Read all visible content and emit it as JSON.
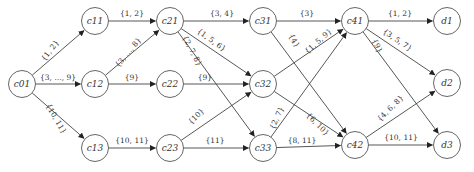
{
  "diagram": {
    "type": "directed-graph",
    "nodes": [
      {
        "id": "c01",
        "label": "c01",
        "x": 22,
        "y": 84
      },
      {
        "id": "c11",
        "label": "c11",
        "x": 95,
        "y": 21
      },
      {
        "id": "c12",
        "label": "c12",
        "x": 95,
        "y": 84
      },
      {
        "id": "c13",
        "label": "c13",
        "x": 95,
        "y": 148
      },
      {
        "id": "c21",
        "label": "c21",
        "x": 170,
        "y": 21
      },
      {
        "id": "c22",
        "label": "c22",
        "x": 170,
        "y": 84
      },
      {
        "id": "c23",
        "label": "c23",
        "x": 170,
        "y": 148
      },
      {
        "id": "c31",
        "label": "c31",
        "x": 263,
        "y": 21
      },
      {
        "id": "c32",
        "label": "c32",
        "x": 263,
        "y": 84
      },
      {
        "id": "c33",
        "label": "c33",
        "x": 263,
        "y": 148
      },
      {
        "id": "c41",
        "label": "c41",
        "x": 355,
        "y": 21
      },
      {
        "id": "c42",
        "label": "c42",
        "x": 355,
        "y": 145
      },
      {
        "id": "d1",
        "label": "d1",
        "x": 447,
        "y": 21
      },
      {
        "id": "d2",
        "label": "d2",
        "x": 447,
        "y": 83
      },
      {
        "id": "d3",
        "label": "d3",
        "x": 447,
        "y": 145
      }
    ],
    "edges": [
      {
        "from": "c01",
        "to": "c11",
        "label": "{1, 2}",
        "lx": 52,
        "ly": 52,
        "rot": -52
      },
      {
        "from": "c01",
        "to": "c12",
        "label": "{3, …, 9}",
        "lx": 58,
        "ly": 80,
        "rot": 0
      },
      {
        "from": "c01",
        "to": "c13",
        "label": "{10, 11}",
        "lx": 54,
        "ly": 120,
        "rot": 60
      },
      {
        "from": "c11",
        "to": "c21",
        "label": "{1, 2}",
        "lx": 132,
        "ly": 16,
        "rot": 0
      },
      {
        "from": "c12",
        "to": "c21",
        "label": "{3, …, 8}",
        "lx": 130,
        "ly": 54,
        "rot": -50
      },
      {
        "from": "c12",
        "to": "c22",
        "label": "{9}",
        "lx": 132,
        "ly": 80,
        "rot": 0
      },
      {
        "from": "c13",
        "to": "c23",
        "label": "{10, 11}",
        "lx": 132,
        "ly": 143,
        "rot": 0
      },
      {
        "from": "c21",
        "to": "c31",
        "label": "{3, 4}",
        "lx": 222,
        "ly": 16,
        "rot": 0
      },
      {
        "from": "c21",
        "to": "c32",
        "label": "{1, 5, 6}",
        "lx": 210,
        "ly": 42,
        "rot": 36
      },
      {
        "from": "c21",
        "to": "c33",
        "label": "{2, 7, 8}",
        "lx": 190,
        "ly": 52,
        "rot": 62
      },
      {
        "from": "c22",
        "to": "c32",
        "label": "{9}",
        "lx": 205,
        "ly": 80,
        "rot": 0
      },
      {
        "from": "c23",
        "to": "c32",
        "label": "{10}",
        "lx": 198,
        "ly": 118,
        "rot": -45
      },
      {
        "from": "c23",
        "to": "c33",
        "label": "{11}",
        "lx": 215,
        "ly": 143,
        "rot": 0
      },
      {
        "from": "c31",
        "to": "c41",
        "label": "{3}",
        "lx": 307,
        "ly": 16,
        "rot": 0
      },
      {
        "from": "c31",
        "to": "c42",
        "label": "{4}",
        "lx": 292,
        "ly": 42,
        "rot": 60
      },
      {
        "from": "c32",
        "to": "c41",
        "label": "{1, 5, 9}",
        "lx": 320,
        "ly": 43,
        "rot": -42
      },
      {
        "from": "c32",
        "to": "c42",
        "label": "{6, 10}",
        "lx": 316,
        "ly": 126,
        "rot": 45
      },
      {
        "from": "c33",
        "to": "c41",
        "label": "{2, 7}",
        "lx": 279,
        "ly": 119,
        "rot": -66
      },
      {
        "from": "c33",
        "to": "c42",
        "label": "{8, 11}",
        "lx": 302,
        "ly": 143,
        "rot": 0
      },
      {
        "from": "c41",
        "to": "d1",
        "label": "{1, 2}",
        "lx": 400,
        "ly": 16,
        "rot": 0
      },
      {
        "from": "c41",
        "to": "d2",
        "label": "{3, 5, 7}",
        "lx": 396,
        "ly": 42,
        "rot": 34
      },
      {
        "from": "c41",
        "to": "d3",
        "label": "{9}",
        "lx": 375,
        "ly": 47,
        "rot": 64
      },
      {
        "from": "c42",
        "to": "d2",
        "label": "{4, 6, 8}",
        "lx": 392,
        "ly": 110,
        "rot": -45
      },
      {
        "from": "c42",
        "to": "d3",
        "label": "{10, 11}",
        "lx": 401,
        "ly": 140,
        "rot": 0
      }
    ]
  },
  "style": {
    "line_color": "#444444",
    "node_stroke": "#555555",
    "background": "#ffffff"
  }
}
